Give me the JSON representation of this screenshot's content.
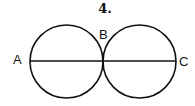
{
  "figure": {
    "number_label": "4.",
    "points": [
      {
        "name": "A",
        "x": 30,
        "y": 61
      },
      {
        "name": "B",
        "x": 103,
        "y": 61
      },
      {
        "name": "C",
        "x": 176,
        "y": 61
      }
    ],
    "circles": [
      {
        "cx": 66.5,
        "cy": 61.5,
        "r": 36.5
      },
      {
        "cx": 139.5,
        "cy": 61.5,
        "r": 36.5
      }
    ],
    "segment": {
      "from": "A",
      "to": "C"
    },
    "stroke_color": "#111111"
  }
}
